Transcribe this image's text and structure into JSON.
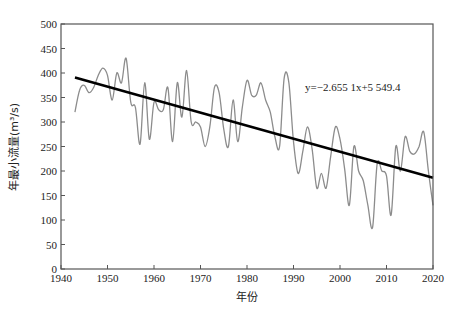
{
  "chart_data": {
    "type": "line",
    "title": "",
    "xlabel": "年份",
    "ylabel": "年最小流量(m³/s)",
    "xlim": [
      1940,
      2020
    ],
    "ylim": [
      0,
      500
    ],
    "xticks": [
      1940,
      1950,
      1960,
      1970,
      1980,
      1990,
      2000,
      2010,
      2020
    ],
    "yticks": [
      0,
      50,
      100,
      150,
      200,
      250,
      300,
      350,
      400,
      450,
      500
    ],
    "grid": false,
    "legend": null,
    "series": [
      {
        "name": "年最小流量",
        "color": "#8c8c8c",
        "x": [
          1943,
          1944,
          1945,
          1946,
          1947,
          1948,
          1949,
          1950,
          1951,
          1952,
          1953,
          1954,
          1955,
          1956,
          1957,
          1958,
          1959,
          1960,
          1961,
          1962,
          1963,
          1964,
          1965,
          1966,
          1967,
          1968,
          1969,
          1970,
          1971,
          1972,
          1973,
          1974,
          1975,
          1976,
          1977,
          1978,
          1979,
          1980,
          1981,
          1982,
          1983,
          1984,
          1985,
          1986,
          1987,
          1988,
          1989,
          1990,
          1991,
          1992,
          1993,
          1994,
          1995,
          1996,
          1997,
          1998,
          1999,
          2000,
          2001,
          2002,
          2003,
          2004,
          2005,
          2006,
          2007,
          2008,
          2009,
          2010,
          2011,
          2012,
          2013,
          2014,
          2015,
          2016,
          2017,
          2018,
          2019,
          2020
        ],
        "values": [
          320,
          365,
          375,
          360,
          370,
          395,
          410,
          395,
          345,
          400,
          380,
          430,
          340,
          330,
          255,
          380,
          265,
          340,
          325,
          325,
          370,
          260,
          380,
          310,
          405,
          300,
          300,
          290,
          250,
          290,
          370,
          360,
          285,
          250,
          345,
          260,
          330,
          385,
          355,
          355,
          380,
          345,
          320,
          270,
          250,
          390,
          380,
          260,
          195,
          240,
          290,
          245,
          165,
          195,
          165,
          230,
          290,
          265,
          205,
          130,
          250,
          200,
          180,
          130,
          85,
          215,
          200,
          190,
          110,
          250,
          200,
          270,
          240,
          235,
          250,
          280,
          200,
          130
        ]
      },
      {
        "name": "线性趋势",
        "color": "#000000",
        "x": [
          1943,
          2020
        ],
        "values": [
          390.7,
          186.3
        ]
      }
    ],
    "annotations": [
      {
        "text": "y=−2.655 1x+5 549.4",
        "x": 1992,
        "y": 362
      }
    ]
  }
}
